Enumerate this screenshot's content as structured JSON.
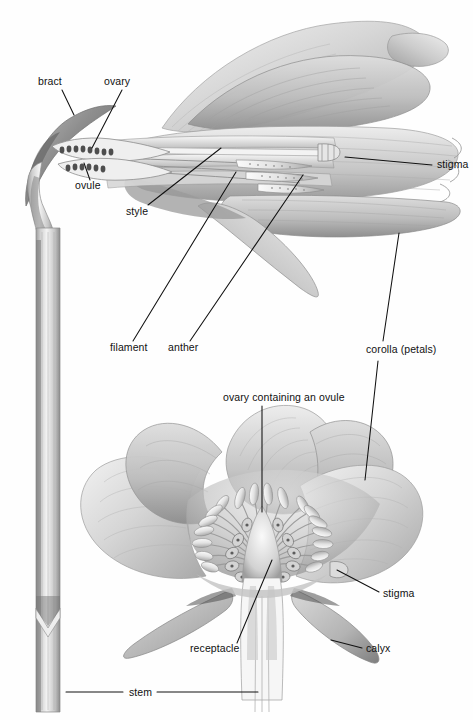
{
  "figure": {
    "style": "grayscale pencil illustration",
    "background_color": "#fefefe",
    "line_color": "#111111",
    "text_color": "#111111",
    "width": 473,
    "height": 720
  },
  "labels": [
    {
      "id": "bract",
      "text": "bract",
      "x": 38,
      "y": 83,
      "align": "start"
    },
    {
      "id": "ovary",
      "text": "ovary",
      "x": 104,
      "y": 83,
      "align": "start"
    },
    {
      "id": "ovule",
      "text": "ovule",
      "x": 75,
      "y": 187,
      "align": "start"
    },
    {
      "id": "style",
      "text": "style",
      "x": 126,
      "y": 213,
      "align": "start"
    },
    {
      "id": "stigma-upper",
      "text": "stigma",
      "x": 437,
      "y": 166,
      "align": "start"
    },
    {
      "id": "filament",
      "text": "filament",
      "x": 110,
      "y": 349,
      "align": "start"
    },
    {
      "id": "anther",
      "text": "anther",
      "x": 168,
      "y": 349,
      "align": "start"
    },
    {
      "id": "corolla",
      "text": "corolla (petals)",
      "x": 366,
      "y": 351,
      "align": "start"
    },
    {
      "id": "ovary-ovule",
      "text": "ovary containing an ovule",
      "x": 223,
      "y": 399,
      "align": "start"
    },
    {
      "id": "stigma-lower",
      "text": "stigma",
      "x": 383,
      "y": 595,
      "align": "start"
    },
    {
      "id": "receptacle",
      "text": "receptacle",
      "x": 190,
      "y": 650,
      "align": "start"
    },
    {
      "id": "calyx",
      "text": "calyx",
      "x": 366,
      "y": 650,
      "align": "start"
    },
    {
      "id": "stem",
      "text": "stem",
      "x": 129,
      "y": 694,
      "align": "start"
    }
  ],
  "leader_lines": [
    {
      "for": "bract",
      "points": "62,90 74,115"
    },
    {
      "for": "ovary",
      "points": "122,90 92,148"
    },
    {
      "for": "ovule",
      "points": "90,180 84,163"
    },
    {
      "for": "style",
      "points": "148,205 221,148"
    },
    {
      "for": "stigma-upper",
      "points": "432,165 345,157"
    },
    {
      "for": "filament",
      "points": "133,341 236,172"
    },
    {
      "for": "anther",
      "points": "190,341 303,175"
    },
    {
      "for": "corolla-up",
      "points": "383,341 399,233"
    },
    {
      "for": "corolla-down",
      "points": "378,361 365,480"
    },
    {
      "for": "ovary-ovule",
      "points": "262,406 262,512"
    },
    {
      "for": "stigma-lower",
      "points": "379,592 337,570"
    },
    {
      "for": "receptacle",
      "points": "237,643 272,560"
    },
    {
      "for": "calyx",
      "points": "362,648 331,640"
    },
    {
      "for": "stem-left",
      "points": "66,692 123,692"
    },
    {
      "for": "stem-right",
      "points": "157,692 258,692"
    }
  ],
  "parts": {
    "upper_flower": "longitudinal section of a lily-like flower in side view showing ovary, ovules, style, stigma, filaments, anthers and petals",
    "lower_flower": "cut-away front view of an open flower showing receptacle, ovary with ovule, radiating stamens, stigma, corolla petals and calyx sepals",
    "stem": "vertical stem connecting both flowers with a node"
  },
  "colors": {
    "petal_light": "#e3e3e3",
    "petal_mid": "#c9c9c9",
    "petal_dark": "#9c9c9c",
    "shadow": "#6f6f6f",
    "deep_shadow": "#4a4a4a",
    "highlight": "#f6f6f6",
    "outline": "#7a7a7a",
    "stem_light": "#d8d8d8",
    "stem_dark": "#8d8d8d",
    "leader": "#111111"
  }
}
